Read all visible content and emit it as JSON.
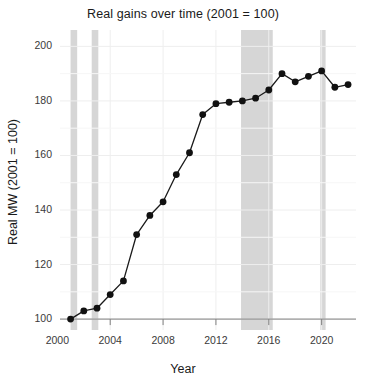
{
  "chart_data": {
    "type": "line",
    "title": "Real gains over time (2001 = 100)",
    "xlabel": "Year",
    "ylabel": "Real MW (2001 = 100)",
    "xlim": [
      2000.2,
      2022.6
    ],
    "ylim": [
      96,
      206
    ],
    "xticks": [
      2000,
      2004,
      2008,
      2012,
      2016,
      2020
    ],
    "yticks": [
      100,
      120,
      140,
      160,
      180,
      200
    ],
    "grid": true,
    "legend": "none",
    "marker": "filled-circle",
    "line_color": "#1a1a1a",
    "marker_color": "#111111",
    "shade_color": "#d6d6d6",
    "x": [
      2001,
      2002,
      2003,
      2004,
      2005,
      2006,
      2007,
      2008,
      2009,
      2010,
      2011,
      2012,
      2013,
      2014,
      2015,
      2016,
      2017,
      2018,
      2019,
      2020,
      2021,
      2022
    ],
    "values": [
      100,
      103,
      104,
      109,
      114,
      131,
      138,
      143,
      153,
      161,
      175,
      179,
      179.5,
      180,
      181,
      184,
      190,
      187,
      189,
      191,
      185,
      186
    ],
    "shaded_bands": [
      {
        "start": 2001.0,
        "end": 2001.5
      },
      {
        "start": 2002.6,
        "end": 2003.1
      },
      {
        "start": 2013.9,
        "end": 2016.3
      },
      {
        "start": 2019.9,
        "end": 2020.3
      }
    ],
    "shaded_bands_label": "recession periods"
  },
  "figure": {
    "background": "#ffffff",
    "axis_color": "#7f7f7f",
    "grid_color": "#eeeeee",
    "text_color": "#1a1a1a"
  }
}
